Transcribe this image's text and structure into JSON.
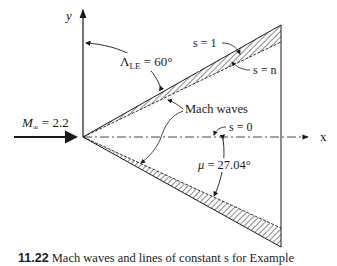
{
  "figure": {
    "labels": {
      "y_axis": "y",
      "x_axis": "x",
      "sweep_symbol": "Λ",
      "sweep_subscript": "LE",
      "sweep_value": " = 60°",
      "freestream_symbol": "M",
      "freestream_subscript": "∞",
      "freestream_value": " = 2.2",
      "s1": "s = 1",
      "sn": "s = n",
      "s0": "s = 0",
      "mach_waves": "Mach waves",
      "mu_symbol": "μ",
      "mu_value": " = 27.04°"
    },
    "geometry": {
      "apex": [
        83,
        137
      ],
      "trailing_edge_x": 281,
      "upper_outer_tip_y": 25,
      "upper_inner_tip_y": 42,
      "lower_outer_tip_y": 247,
      "lower_inner_tip_y": 228,
      "sweep_angle_deg": 60,
      "mach_angle_deg": 27.04,
      "mach_number": 2.2
    },
    "colors": {
      "line": "#1a1a1a",
      "background": "#ffffff"
    }
  },
  "caption": {
    "number": "11.22",
    "text": " Mach waves and lines of constant s for Example"
  }
}
